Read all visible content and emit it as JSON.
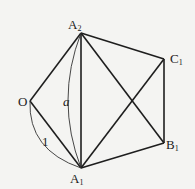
{
  "diagram": {
    "type": "geometry",
    "colors": {
      "line": "#1e1e1e",
      "background": "#f4f4f2",
      "text": "#222222"
    },
    "points": {
      "A2": {
        "name": "A",
        "sub": "2",
        "x": 81,
        "y": 33
      },
      "C1": {
        "name": "C",
        "sub": "1",
        "x": 164,
        "y": 59
      },
      "O": {
        "name": "O",
        "sub": "",
        "x": 30,
        "y": 101
      },
      "B1": {
        "name": "B",
        "sub": "1",
        "x": 164,
        "y": 143
      },
      "A1": {
        "name": "A",
        "sub": "1",
        "x": 81,
        "y": 168
      }
    },
    "segments": [
      [
        "O",
        "A2"
      ],
      [
        "O",
        "A1"
      ],
      [
        "A2",
        "A1"
      ],
      [
        "A2",
        "C1"
      ],
      [
        "A2",
        "B1"
      ],
      [
        "C1",
        "B1"
      ],
      [
        "A1",
        "C1"
      ],
      [
        "A1",
        "B1"
      ]
    ],
    "braces": [
      {
        "from": "A2",
        "to": "A1",
        "label": "a",
        "italic": true
      },
      {
        "from": "O",
        "to": "A1",
        "label": "1",
        "italic": false
      }
    ]
  }
}
